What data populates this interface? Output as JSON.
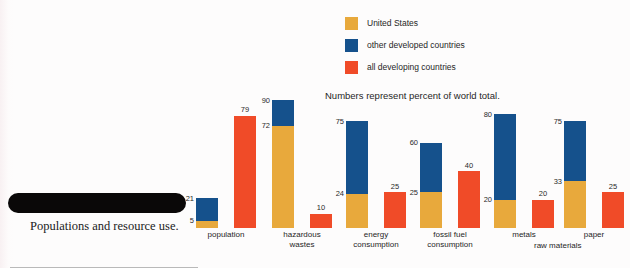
{
  "caption": {
    "text": "Populations and resource use."
  },
  "legend": {
    "items": [
      {
        "label": "United States",
        "color": "#e8a93c"
      },
      {
        "label": "other developed countries",
        "color": "#15518c"
      },
      {
        "label": "all developing countries",
        "color": "#f04b28"
      }
    ]
  },
  "subtitle": "Numbers represent percent of world total.",
  "group_span_label": "raw materials",
  "chart_data": {
    "type": "bar",
    "title": "",
    "subtitle": "Numbers represent percent of world total.",
    "xlabel": "",
    "ylabel": "percent of world total",
    "ylim": [
      0,
      90
    ],
    "grid": false,
    "legend_position": "top-center",
    "note": "Left bar of each pair is a stacked bar: United States segment at bottom, other developed countries stacked above it (upper number is the cumulative top). Right bar is all developing countries.",
    "categories": [
      "population",
      "hazardous wastes",
      "energy consumption",
      "fossil fuel consumption",
      "metals",
      "paper"
    ],
    "series": [
      {
        "name": "United States",
        "color": "#e8a93c",
        "values": [
          5,
          72,
          24,
          25,
          20,
          33
        ]
      },
      {
        "name": "other developed countries",
        "color": "#15518c",
        "cumulative_top": [
          21,
          90,
          75,
          60,
          80,
          75
        ],
        "values": [
          16,
          18,
          51,
          35,
          60,
          42
        ]
      },
      {
        "name": "all developing countries",
        "color": "#f04b28",
        "values": [
          79,
          10,
          25,
          40,
          20,
          25
        ]
      }
    ],
    "groups": [
      {
        "category": "population",
        "category_lines": [
          "population"
        ],
        "stacked_bar": {
          "us": 5,
          "other_developed_top": 21
        },
        "developing_bar": 79
      },
      {
        "category": "hazardous wastes",
        "category_lines": [
          "hazardous",
          "wastes"
        ],
        "stacked_bar": {
          "us": 72,
          "other_developed_top": 90
        },
        "developing_bar": 10
      },
      {
        "category": "energy consumption",
        "category_lines": [
          "energy",
          "consumption"
        ],
        "stacked_bar": {
          "us": 24,
          "other_developed_top": 75
        },
        "developing_bar": 25
      },
      {
        "category": "fossil fuel consumption",
        "category_lines": [
          "fossil fuel",
          "consumption"
        ],
        "stacked_bar": {
          "us": 25,
          "other_developed_top": 60
        },
        "developing_bar": 40
      },
      {
        "category": "metals",
        "category_lines": [
          "metals"
        ],
        "stacked_bar": {
          "us": 20,
          "other_developed_top": 80
        },
        "developing_bar": 20
      },
      {
        "category": "paper",
        "category_lines": [
          "paper"
        ],
        "stacked_bar": {
          "us": 33,
          "other_developed_top": 75
        },
        "developing_bar": 25
      }
    ]
  }
}
